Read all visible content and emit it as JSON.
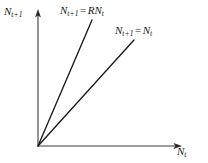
{
  "figure": {
    "name": "recruitment-plot",
    "background_color": "#ffffff",
    "ink_color": "#1a1a1a"
  },
  "axes": {
    "x": {
      "label_var": "N",
      "label_sub": "t",
      "name": "x-axis",
      "origin_px": [
        38,
        146
      ],
      "end_px": [
        182,
        146
      ],
      "arrow": "right"
    },
    "y": {
      "label_var": "N",
      "label_sub": "t+1",
      "name": "y-axis",
      "origin_px": [
        38,
        146
      ],
      "end_px": [
        38,
        10
      ],
      "arrow": "up"
    }
  },
  "lines": [
    {
      "id": "line-steep",
      "label_var": "N",
      "label_sub": "t+1",
      "label_eq": "=",
      "label_coef": "R",
      "label_rhs_var": "N",
      "label_rhs_sub": "t",
      "from_px": [
        38,
        146
      ],
      "to_px": [
        92,
        20
      ]
    },
    {
      "id": "line-unity",
      "label_var": "N",
      "label_sub": "t+1",
      "label_eq": "=",
      "label_coef": "",
      "label_rhs_var": "N",
      "label_rhs_sub": "t",
      "from_px": [
        38,
        146
      ],
      "to_px": [
        134,
        40
      ]
    }
  ]
}
